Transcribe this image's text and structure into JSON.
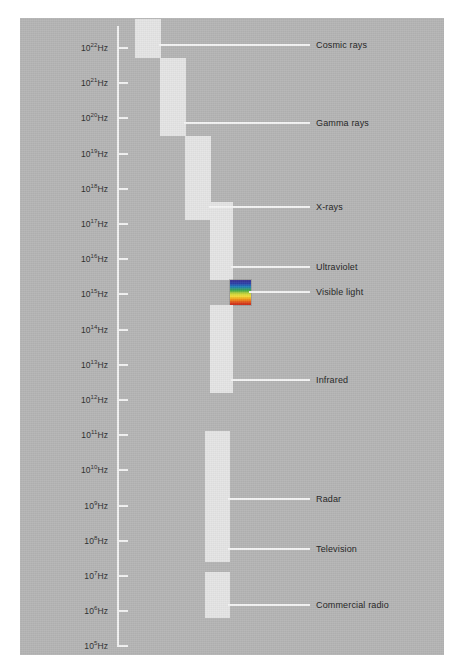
{
  "figure": {
    "background_color": "#b4b4b4",
    "bar_color": "#e4e4e4",
    "line_color": "#f2f2f2",
    "text_color": "#222222"
  },
  "axis": {
    "unit": "Hz",
    "base": "10",
    "scale": "logarithmic",
    "exponents": [
      22,
      21,
      20,
      19,
      18,
      17,
      16,
      15,
      14,
      13,
      12,
      11,
      10,
      9,
      8,
      7,
      6,
      5
    ],
    "ticks": [
      {
        "label": "10",
        "exponent": "22",
        "unit": "Hz"
      },
      {
        "label": "10",
        "exponent": "21",
        "unit": "Hz"
      },
      {
        "label": "10",
        "exponent": "20",
        "unit": "Hz"
      },
      {
        "label": "10",
        "exponent": "19",
        "unit": "Hz"
      },
      {
        "label": "10",
        "exponent": "18",
        "unit": "Hz"
      },
      {
        "label": "10",
        "exponent": "17",
        "unit": "Hz"
      },
      {
        "label": "10",
        "exponent": "16",
        "unit": "Hz"
      },
      {
        "label": "10",
        "exponent": "15",
        "unit": "Hz"
      },
      {
        "label": "10",
        "exponent": "14",
        "unit": "Hz"
      },
      {
        "label": "10",
        "exponent": "13",
        "unit": "Hz"
      },
      {
        "label": "10",
        "exponent": "12",
        "unit": "Hz"
      },
      {
        "label": "10",
        "exponent": "11",
        "unit": "Hz"
      },
      {
        "label": "10",
        "exponent": "10",
        "unit": "Hz"
      },
      {
        "label": "10",
        "exponent": "9",
        "unit": "Hz"
      },
      {
        "label": "10",
        "exponent": "8",
        "unit": "Hz"
      },
      {
        "label": "10",
        "exponent": "7",
        "unit": "Hz"
      },
      {
        "label": "10",
        "exponent": "6",
        "unit": "Hz"
      },
      {
        "label": "10",
        "exponent": "5",
        "unit": "Hz"
      }
    ]
  },
  "bands": [
    {
      "name": "cosmic-rays",
      "label": "Cosmic rays",
      "colored": false
    },
    {
      "name": "gamma-rays",
      "label": "Gamma rays",
      "colored": false
    },
    {
      "name": "x-rays",
      "label": "X-rays",
      "colored": false
    },
    {
      "name": "ultraviolet",
      "label": "Ultraviolet",
      "colored": false
    },
    {
      "name": "visible-light",
      "label": "Visible light",
      "colored": true
    },
    {
      "name": "infrared",
      "label": "Infrared",
      "colored": false
    },
    {
      "name": "radar",
      "label": "Radar",
      "colored": false
    },
    {
      "name": "television",
      "label": "Television",
      "colored": false
    },
    {
      "name": "commercial-radio",
      "label": "Commercial radio",
      "colored": false
    }
  ],
  "chart_data": {
    "type": "bar",
    "ylabel": "Frequency",
    "xlabel": "",
    "ylim": [
      5,
      22
    ],
    "grid": false,
    "legend": "right-labels",
    "categories": [
      "Cosmic rays",
      "Gamma rays",
      "X-rays",
      "Ultraviolet",
      "Visible light",
      "Infrared",
      "Radar",
      "Television",
      "Commercial radio"
    ],
    "series": [
      {
        "name": "frequency range (log10 Hz)",
        "values": [
          {
            "band": "Cosmic rays",
            "high_exponent": 22.3,
            "low_exponent": 21.2
          },
          {
            "band": "Gamma rays",
            "high_exponent": 21.2,
            "low_exponent": 19.0
          },
          {
            "band": "X-rays",
            "high_exponent": 19.0,
            "low_exponent": 16.6
          },
          {
            "band": "Ultraviolet",
            "high_exponent": 17.1,
            "low_exponent": 14.9
          },
          {
            "band": "Visible light",
            "high_exponent": 14.9,
            "low_exponent": 14.2
          },
          {
            "band": "Infrared",
            "high_exponent": 14.2,
            "low_exponent": 11.7
          },
          {
            "band": "Radar",
            "high_exponent": 10.6,
            "low_exponent": 8.3
          },
          {
            "band": "Television",
            "high_exponent": 8.3,
            "low_exponent": 6.9
          },
          {
            "band": "Commercial radio",
            "high_exponent": 6.6,
            "low_exponent": 5.3
          }
        ]
      }
    ],
    "visible_light_colors": [
      "#3b2f8f",
      "#2b3fa8",
      "#1f7fb8",
      "#3fa84a",
      "#b9d13a",
      "#f2e03a",
      "#f0a018",
      "#e2541c",
      "#c81f14"
    ]
  }
}
